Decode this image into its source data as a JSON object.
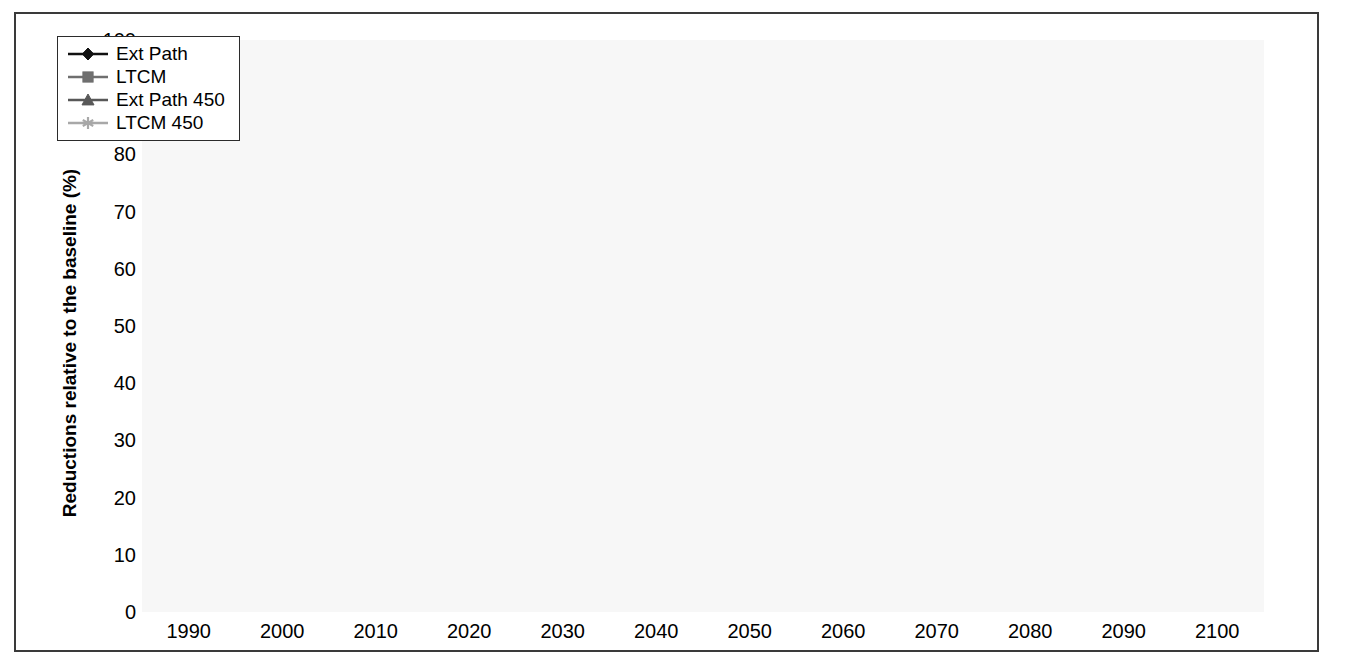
{
  "chart_data": {
    "type": "line",
    "title": "",
    "xlabel": "",
    "ylabel": "Reductions relative to the baseline (%)",
    "xlim": [
      1985,
      2105
    ],
    "ylim": [
      0,
      100
    ],
    "ytick_step": 10,
    "grid": true,
    "legend_position": "top-left",
    "x": [
      1990,
      2000,
      2010,
      2020,
      2030,
      2040,
      2050,
      2060,
      2070,
      2080,
      2090,
      2100
    ],
    "xtick_labels": [
      "1990",
      "2000",
      "2010",
      "2020",
      "2030",
      "2040",
      "2050",
      "2060",
      "2070",
      "2080",
      "2090",
      "2100"
    ],
    "ytick_labels": [
      "0",
      "10",
      "20",
      "30",
      "40",
      "50",
      "60",
      "70",
      "80",
      "90",
      "100"
    ],
    "series": [
      {
        "name": "Ext Path",
        "marker": "diamond",
        "color": "#111111",
        "values": [
          0,
          0.8,
          10.5,
          20.7,
          30.0,
          33.5,
          39.0,
          43.0,
          47.0,
          50.7,
          50.5,
          50.1
        ]
      },
      {
        "name": "LTCM",
        "marker": "square",
        "color": "#6f6f6f",
        "values": [
          0,
          2.3,
          4.0,
          6.7,
          15.1,
          21.0,
          33.2,
          40.5,
          52.1,
          60.1,
          66.1,
          67.3
        ]
      },
      {
        "name": "Ext Path 450",
        "marker": "triangle",
        "color": "#585858",
        "values": [
          0,
          9.5,
          22.3,
          33.9,
          45.9,
          52.5,
          59.6,
          62.6,
          65.9,
          66.7,
          66.2,
          66.2
        ]
      },
      {
        "name": "LTCM 450",
        "marker": "star",
        "color": "#a8a8a8",
        "values": [
          0,
          6.4,
          5.9,
          6.2,
          15.1,
          49.0,
          62.1,
          76.9,
          77.3,
          80.3,
          83.1,
          85.9
        ]
      }
    ]
  },
  "legend": {
    "entries": [
      {
        "label": "Ext Path"
      },
      {
        "label": "LTCM"
      },
      {
        "label": "Ext Path 450"
      },
      {
        "label": "LTCM 450"
      }
    ]
  },
  "colors": {
    "ext_path": "#111111",
    "ltcm": "#6f6f6f",
    "ext_path_450": "#585858",
    "ltcm_450": "#a8a8a8",
    "plot_background": "#f7f7f7",
    "gridline": "#c9c9c9",
    "axis": "#4a4a4a",
    "frame": "#3a3a3a"
  }
}
